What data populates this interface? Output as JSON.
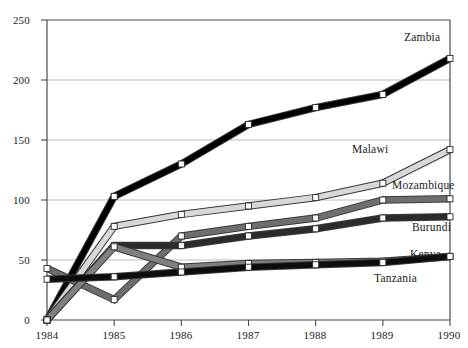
{
  "chart_data": {
    "type": "line",
    "title": "",
    "xlabel": "",
    "ylabel": "",
    "x": [
      1984,
      1985,
      1986,
      1987,
      1988,
      1989,
      1990
    ],
    "xtick_labels": [
      "1984",
      "1985",
      "1986",
      "1987",
      "1988",
      "1989",
      "1990"
    ],
    "ytick_labels": [
      "0",
      "50",
      "100",
      "150",
      "200",
      "250"
    ],
    "yticks": [
      0,
      50,
      100,
      150,
      200,
      250
    ],
    "ylim": [
      0,
      250
    ],
    "grid": "horizontal",
    "legend": "inline-right-labels",
    "markers": "open-square",
    "series": [
      {
        "name": "Zambia",
        "color": "#000000",
        "values": [
          0,
          103,
          130,
          163,
          177,
          188,
          218
        ]
      },
      {
        "name": "Malawi",
        "color": "#d8d8d8",
        "values": [
          0,
          78,
          88,
          95,
          102,
          114,
          142
        ]
      },
      {
        "name": "Mozambique",
        "color": "#6e6e6e",
        "values": [
          43,
          17,
          70,
          78,
          85,
          100,
          101
        ]
      },
      {
        "name": "Burundi",
        "color": "#2b2b2b",
        "values": [
          0,
          62,
          62,
          70,
          76,
          85,
          86
        ]
      },
      {
        "name": "Kenya",
        "color": "#808080",
        "values": [
          0,
          61,
          44,
          47,
          48,
          49,
          53
        ]
      },
      {
        "name": "Tanzania",
        "color": "#0d0d0d",
        "values": [
          34,
          36,
          40,
          44,
          46,
          48,
          53
        ]
      }
    ]
  },
  "labels": {
    "zambia": "Zambia",
    "malawi": "Malawi",
    "mozambique": "Mozambique",
    "burundi": "Burundi",
    "kenya": "Kenya",
    "tanzania": "Tanzania"
  },
  "yticks": {
    "t0": "0",
    "t1": "50",
    "t2": "100",
    "t3": "150",
    "t4": "200",
    "t5": "250"
  },
  "xticks": {
    "t0": "1984",
    "t1": "1985",
    "t2": "1986",
    "t3": "1987",
    "t4": "1988",
    "t5": "1989",
    "t6": "1990"
  }
}
